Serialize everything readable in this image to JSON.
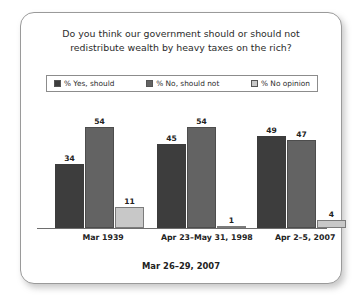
{
  "card": {
    "title_line1": "Do you think our government should or should not",
    "title_line2": "redistribute wealth by heavy taxes on the rich?",
    "footer": "Mar 26–29, 2007"
  },
  "legend": {
    "items": [
      {
        "label": "% Yes, should",
        "color": "#3d3d3d"
      },
      {
        "label": "% No, should not",
        "color": "#636363"
      },
      {
        "label": "% No opinion",
        "color": "#c8c8c8"
      }
    ]
  },
  "chart_data": {
    "type": "bar",
    "title": "Do you think our government should or should not redistribute wealth by heavy taxes on the rich?",
    "xlabel": "",
    "ylabel": "",
    "ylim": [
      0,
      60
    ],
    "grid": false,
    "legend_position": "top",
    "categories": [
      "Mar 1939",
      "Apr 23–May 31, 1998",
      "Apr 2–5, 2007"
    ],
    "series": [
      {
        "name": "% Yes, should",
        "color": "#3d3d3d",
        "values": [
          34,
          45,
          49
        ]
      },
      {
        "name": "% No, should not",
        "color": "#636363",
        "values": [
          54,
          54,
          47
        ]
      },
      {
        "name": "% No opinion",
        "color": "#c8c8c8",
        "values": [
          11,
          1,
          4
        ]
      }
    ],
    "annotations": [
      "Mar 26–29, 2007"
    ]
  }
}
